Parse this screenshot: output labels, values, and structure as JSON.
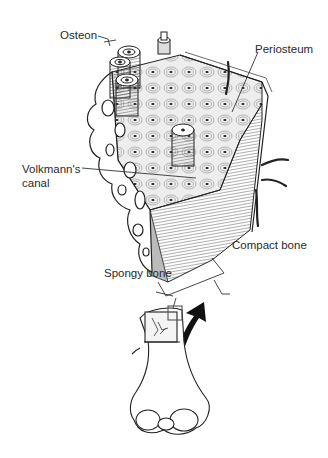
{
  "figure": {
    "labels": {
      "osteon": "Osteon",
      "periosteum": "Periosteum",
      "volkmanns_line1": "Volkmann's",
      "volkmanns_line2": "canal",
      "compact_bone": "Compact bone",
      "spongy_bone": "Spongy bone"
    }
  }
}
